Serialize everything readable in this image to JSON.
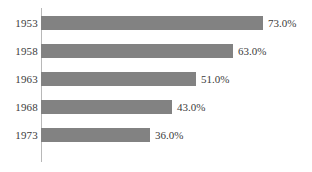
{
  "chart_data": {
    "type": "bar",
    "orientation": "horizontal",
    "title": "",
    "subtitle": "",
    "xlabel": "",
    "ylabel": "",
    "categories": [
      "1953",
      "1958",
      "1963",
      "1968",
      "1973"
    ],
    "values": [
      73.0,
      63.0,
      51.0,
      43.0,
      36.0
    ],
    "value_labels": [
      "73.0%",
      "63.0%",
      "51.0%",
      "43.0%",
      "36.0%"
    ],
    "unit": "%",
    "xlim": [
      0,
      73
    ],
    "grid": false,
    "legend": false,
    "tick_labels": {
      "y": [
        "1953",
        "1958",
        "1963",
        "1968",
        "1973"
      ],
      "x": []
    },
    "annotations": [],
    "colors": {
      "bar": "#828282",
      "axis": "#b8b8b8",
      "text": "#3b3b3b",
      "background": "#ffffff"
    }
  }
}
